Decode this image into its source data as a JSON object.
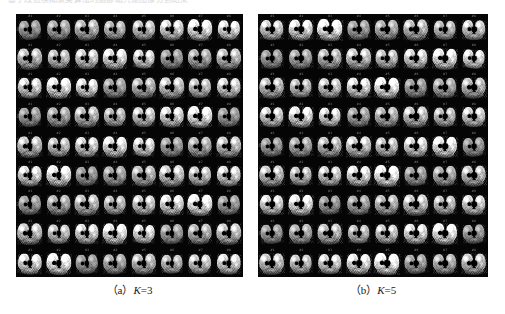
{
  "figure": {
    "header_clipped_text": "基于改进模糊聚类算法的脑部磁共振图像分割结果",
    "background_color": "#ffffff",
    "panel_background_color": "#050505"
  },
  "panels": [
    {
      "id": "panel-a",
      "caption_prefix": "（a）",
      "caption_variable": "K",
      "caption_value": "=3",
      "caption_full": "（a）K=3",
      "cluster_count": 3,
      "grid_columns": 8,
      "grid_rows": 9,
      "slice_count": 72,
      "modality": "brain-mri-axial-montage",
      "slice_labels": [
        "#1",
        "#2",
        "#3",
        "#4",
        "#5",
        "#6",
        "#7",
        "#8"
      ],
      "row_labels": [
        "R1",
        "R2",
        "R3",
        "R4",
        "R5",
        "R6",
        "R7",
        "R8",
        "R9"
      ]
    },
    {
      "id": "panel-b",
      "caption_prefix": "（b）",
      "caption_variable": "K",
      "caption_value": "=5",
      "caption_full": "（b）K=5",
      "cluster_count": 5,
      "grid_columns": 8,
      "grid_rows": 9,
      "slice_count": 72,
      "modality": "brain-mri-axial-montage",
      "slice_labels": [
        "#1",
        "#2",
        "#3",
        "#4",
        "#5",
        "#6",
        "#7",
        "#8"
      ],
      "row_labels": [
        "R1",
        "R2",
        "R3",
        "R4",
        "R5",
        "R6",
        "R7",
        "R8",
        "R9"
      ]
    }
  ]
}
